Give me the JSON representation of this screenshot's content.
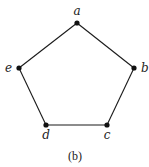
{
  "diagram": {
    "type": "graph",
    "caption": "(b)",
    "colors": {
      "line": "#1a1a1a",
      "vertex": "#111111",
      "text": "#222222"
    },
    "vertices": [
      {
        "id": "a",
        "label": "a"
      },
      {
        "id": "b",
        "label": "b"
      },
      {
        "id": "c",
        "label": "c"
      },
      {
        "id": "d",
        "label": "d"
      },
      {
        "id": "e",
        "label": "e"
      }
    ],
    "edges": [
      [
        "a",
        "b"
      ],
      [
        "b",
        "c"
      ],
      [
        "c",
        "d"
      ],
      [
        "d",
        "e"
      ],
      [
        "e",
        "a"
      ]
    ]
  }
}
